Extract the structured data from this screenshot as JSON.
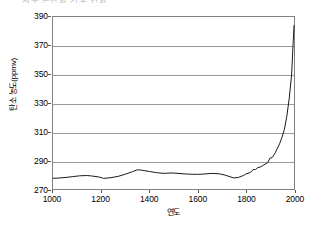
{
  "figure": {
    "title_fragment": "지구 온난화 기후 변화",
    "background_color": "#ffffff"
  },
  "chart_data": {
    "type": "line",
    "title": "",
    "xlabel": "연도",
    "ylabel": "탄소 농도(ppmv)",
    "xlim": [
      1000,
      2000
    ],
    "ylim": [
      270,
      390
    ],
    "xticks": [
      1000,
      1200,
      1400,
      1600,
      1800,
      2000
    ],
    "yticks": [
      270,
      290,
      310,
      330,
      350,
      370,
      390
    ],
    "xtick_labels": [
      "1000",
      "1200",
      "1400",
      "1600",
      "1800",
      "2000"
    ],
    "ytick_labels": [
      "270",
      "290",
      "310",
      "330",
      "350",
      "370",
      "390"
    ],
    "grid": "horizontal",
    "grid_color": "#9a9a9a",
    "legend": "none",
    "line_color": "#1a1a1a",
    "line_width": 1.0,
    "series": [
      {
        "name": "탄소 농도",
        "x": [
          1000,
          1020,
          1050,
          1080,
          1110,
          1140,
          1160,
          1190,
          1210,
          1240,
          1270,
          1300,
          1330,
          1350,
          1370,
          1400,
          1430,
          1460,
          1490,
          1510,
          1540,
          1570,
          1600,
          1630,
          1660,
          1690,
          1710,
          1730,
          1750,
          1770,
          1790,
          1800,
          1820,
          1830,
          1840,
          1850,
          1860,
          1870,
          1880,
          1890,
          1900,
          1910,
          1920,
          1930,
          1940,
          1950,
          1960,
          1970,
          1980,
          1990,
          2000
        ],
        "y": [
          277.5,
          277.6,
          278.0,
          278.6,
          279.2,
          279.4,
          279.1,
          278.4,
          277.4,
          277.9,
          278.8,
          280.3,
          282.1,
          283.4,
          283.1,
          282.2,
          281.4,
          280.9,
          281.2,
          281.0,
          280.6,
          280.3,
          280.2,
          280.5,
          280.9,
          280.6,
          279.9,
          278.8,
          277.7,
          278.1,
          279.4,
          280.4,
          281.6,
          283.5,
          283.6,
          285.0,
          285.3,
          286.3,
          287.3,
          288.2,
          291.5,
          292.0,
          294.6,
          298.0,
          301.5,
          306.0,
          311.5,
          320.5,
          333.0,
          349.5,
          384.0
        ]
      }
    ],
    "annotation": "산업혁명 이후 급격한 상승 (hockey stick)"
  }
}
